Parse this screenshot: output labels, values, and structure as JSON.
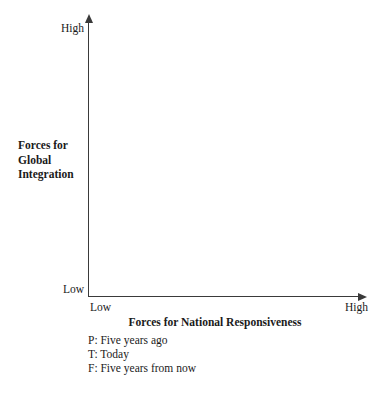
{
  "figure": {
    "background_color": "#ffffff",
    "line_color": "#3a3a3a",
    "text_color": "#1a1a1a"
  },
  "y_axis": {
    "title_lines": [
      "Forces for",
      "Global",
      "Integration"
    ],
    "title_full": "Forces for Global Integration",
    "high_label": "High",
    "low_label": "Low"
  },
  "x_axis": {
    "title": "Forces for National Responsiveness",
    "high_label": "High",
    "low_label": "Low"
  },
  "legend": {
    "items": [
      {
        "key": "P",
        "text": "P: Five years ago"
      },
      {
        "key": "T",
        "text": "T: Today"
      },
      {
        "key": "F",
        "text": "F: Five years from now"
      }
    ]
  },
  "chart_data": {
    "type": "scatter",
    "title": "",
    "subtitle": "",
    "xlabel": "Forces for National Responsiveness",
    "ylabel": "Forces for Global Integration",
    "x_tick_labels": [
      "Low",
      "High"
    ],
    "y_tick_labels": [
      "Low",
      "High"
    ],
    "xlim": [
      0,
      1
    ],
    "ylim": [
      0,
      1
    ],
    "grid": false,
    "legend_position": "below-plot-left",
    "series": [
      {
        "name": "P: Five years ago",
        "marker": "P",
        "x": [],
        "y": []
      },
      {
        "name": "T: Today",
        "marker": "T",
        "x": [],
        "y": []
      },
      {
        "name": "F: Five years from now",
        "marker": "F",
        "x": [],
        "y": []
      }
    ],
    "annotations": [],
    "note": "Blank template grid: axes and legend keys drawn, no data points plotted."
  }
}
